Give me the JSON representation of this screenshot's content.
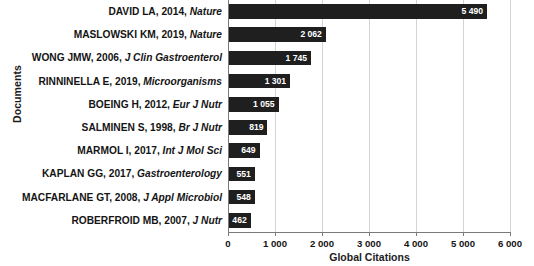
{
  "chart_data": {
    "type": "bar",
    "orientation": "horizontal",
    "title": "",
    "xlabel": "Global Citations",
    "ylabel": "Documents",
    "xlim": [
      0,
      6000
    ],
    "grid": true,
    "legend": false,
    "xticks": [
      "0",
      "1 000",
      "2 000",
      "3 000",
      "4 000",
      "5 000",
      "6 000"
    ],
    "xtick_values": [
      0,
      1000,
      2000,
      3000,
      4000,
      5000,
      6000
    ],
    "bar_color": "#1f1f1f",
    "categories": [
      "DAVID LA, 2014, Nature",
      "MASLOWSKI KM, 2019, Nature",
      "WONG JMW, 2006, J Clin Gastroenterol",
      "RINNINELLA E, 2019, Microorganisms",
      "BOEING H, 2012, Eur J Nutr",
      "SALMINEN S, 1998, Br J Nutr",
      "MARMOL I, 2017, Int J Mol Sci",
      "KAPLAN GG, 2017, Gastroenterology",
      "MACFARLANE GT, 2008, J Appl Microbiol",
      "ROBERFROID MB, 2007, J Nutr"
    ],
    "items": [
      {
        "author": "DAVID LA, 2014,",
        "journal": "Nature",
        "value": 5490,
        "label": "5 490"
      },
      {
        "author": "MASLOWSKI KM, 2019,",
        "journal": "Nature",
        "value": 2062,
        "label": "2 062"
      },
      {
        "author": "WONG JMW, 2006,",
        "journal": "J Clin Gastroenterol",
        "value": 1745,
        "label": "1 745"
      },
      {
        "author": "RINNINELLA E, 2019,",
        "journal": "Microorganisms",
        "value": 1301,
        "label": "1 301"
      },
      {
        "author": "BOEING H, 2012,",
        "journal": "Eur J Nutr",
        "value": 1055,
        "label": "1 055"
      },
      {
        "author": "SALMINEN S, 1998,",
        "journal": "Br J Nutr",
        "value": 819,
        "label": "819"
      },
      {
        "author": "MARMOL I, 2017,",
        "journal": "Int J Mol Sci",
        "value": 649,
        "label": "649"
      },
      {
        "author": "KAPLAN GG, 2017,",
        "journal": "Gastroenterology",
        "value": 551,
        "label": "551"
      },
      {
        "author": "MACFARLANE GT, 2008,",
        "journal": "J Appl Microbiol",
        "value": 548,
        "label": "548"
      },
      {
        "author": "ROBERFROID MB, 2007,",
        "journal": "J Nutr",
        "value": 462,
        "label": "462"
      }
    ],
    "values": [
      5490,
      2062,
      1745,
      1301,
      1055,
      819,
      649,
      551,
      548,
      462
    ]
  }
}
